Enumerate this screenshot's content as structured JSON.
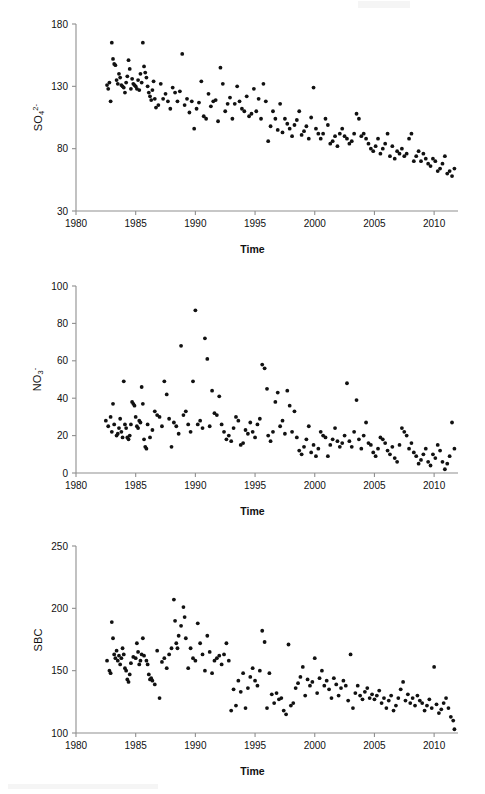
{
  "figure": {
    "panel_count": 3,
    "background": "#ffffff",
    "axis_color": "#8f8f8f",
    "point_color": "#111111"
  },
  "chart_data": [
    {
      "type": "scatter",
      "title": "",
      "ylabel": "SO4 2-",
      "ylabel_base": "SO",
      "ylabel_sub": "4",
      "ylabel_sup": "2-",
      "xlabel": "Time",
      "xlim": [
        1980,
        2012
      ],
      "ylim": [
        30,
        180
      ],
      "xticks": [
        1980,
        1985,
        1990,
        1995,
        2000,
        2005,
        2010
      ],
      "yticks": [
        30,
        80,
        130,
        180
      ],
      "grid": false,
      "legend": "none",
      "x": [
        1982.6,
        1982.7,
        1982.8,
        1982.9,
        1983.0,
        1983.1,
        1983.2,
        1983.3,
        1983.4,
        1983.5,
        1983.6,
        1983.7,
        1983.8,
        1983.9,
        1984.0,
        1984.1,
        1984.2,
        1984.3,
        1984.4,
        1984.5,
        1984.6,
        1984.7,
        1984.8,
        1984.9,
        1985.0,
        1985.1,
        1985.2,
        1985.3,
        1985.4,
        1985.5,
        1985.6,
        1985.7,
        1985.8,
        1985.9,
        1986.0,
        1986.1,
        1986.2,
        1986.3,
        1986.4,
        1986.5,
        1986.6,
        1986.7,
        1986.9,
        1987.1,
        1987.3,
        1987.5,
        1987.7,
        1987.9,
        1988.1,
        1988.3,
        1988.5,
        1988.7,
        1988.9,
        1989.1,
        1989.3,
        1989.5,
        1989.7,
        1989.9,
        1990.1,
        1990.3,
        1990.5,
        1990.7,
        1990.9,
        1991.1,
        1991.3,
        1991.5,
        1991.7,
        1991.9,
        1992.1,
        1992.3,
        1992.5,
        1992.7,
        1992.9,
        1993.1,
        1993.3,
        1993.5,
        1993.7,
        1993.9,
        1994.1,
        1994.3,
        1994.5,
        1994.7,
        1994.9,
        1995.1,
        1995.3,
        1995.5,
        1995.7,
        1995.9,
        1996.1,
        1996.3,
        1996.5,
        1996.7,
        1996.9,
        1997.1,
        1997.3,
        1997.5,
        1997.7,
        1997.9,
        1998.1,
        1998.3,
        1998.5,
        1998.7,
        1998.9,
        1999.1,
        1999.3,
        1999.5,
        1999.7,
        1999.9,
        2000.1,
        2000.3,
        2000.5,
        2000.7,
        2000.9,
        2001.1,
        2001.3,
        2001.5,
        2001.7,
        2001.9,
        2002.1,
        2002.3,
        2002.5,
        2002.7,
        2002.9,
        2003.1,
        2003.3,
        2003.5,
        2003.7,
        2003.9,
        2004.1,
        2004.3,
        2004.5,
        2004.7,
        2004.9,
        2005.1,
        2005.3,
        2005.5,
        2005.7,
        2005.9,
        2006.1,
        2006.3,
        2006.5,
        2006.7,
        2006.9,
        2007.1,
        2007.3,
        2007.5,
        2007.7,
        2007.9,
        2008.1,
        2008.3,
        2008.5,
        2008.7,
        2008.9,
        2009.1,
        2009.3,
        2009.5,
        2009.7,
        2009.9,
        2010.1,
        2010.3,
        2010.5,
        2010.7,
        2010.9,
        2011.1,
        2011.3,
        2011.5,
        2011.7
      ],
      "y": [
        131,
        128,
        133,
        118,
        165,
        152,
        148,
        147,
        135,
        132,
        140,
        137,
        131,
        130,
        129,
        125,
        133,
        138,
        151,
        144,
        128,
        136,
        132,
        131,
        130,
        128,
        135,
        127,
        140,
        133,
        165,
        146,
        141,
        137,
        130,
        125,
        122,
        119,
        127,
        134,
        120,
        113,
        115,
        132,
        120,
        124,
        118,
        112,
        129,
        125,
        118,
        126,
        156,
        115,
        120,
        109,
        118,
        96,
        112,
        117,
        134,
        106,
        104,
        124,
        114,
        118,
        119,
        102,
        145,
        132,
        110,
        116,
        121,
        104,
        116,
        130,
        118,
        112,
        110,
        122,
        106,
        108,
        128,
        110,
        120,
        104,
        132,
        118,
        86,
        98,
        110,
        104,
        95,
        116,
        93,
        104,
        100,
        96,
        90,
        99,
        103,
        110,
        91,
        94,
        98,
        88,
        105,
        129,
        96,
        92,
        88,
        92,
        104,
        99,
        84,
        86,
        90,
        82,
        92,
        96,
        90,
        88,
        84,
        86,
        92,
        108,
        104,
        90,
        92,
        88,
        84,
        80,
        78,
        82,
        88,
        76,
        80,
        84,
        92,
        74,
        82,
        72,
        78,
        76,
        80,
        74,
        76,
        88,
        92,
        70,
        74,
        78,
        70,
        76,
        72,
        68,
        66,
        72,
        70,
        62,
        64,
        68,
        74,
        60,
        62,
        58,
        64,
        56,
        54,
        58,
        52
      ]
    },
    {
      "type": "scatter",
      "title": "",
      "ylabel": "NO3 -",
      "ylabel_base": "NO",
      "ylabel_sub": "3",
      "ylabel_sup": "-",
      "xlabel": "Time",
      "xlim": [
        1980,
        2012
      ],
      "ylim": [
        0,
        100
      ],
      "xticks": [
        1980,
        1985,
        1990,
        1995,
        2000,
        2005,
        2010
      ],
      "yticks": [
        0,
        20,
        40,
        60,
        80,
        100
      ],
      "grid": false,
      "legend": "none",
      "x": [
        1982.5,
        1982.7,
        1982.9,
        1983.0,
        1983.1,
        1983.2,
        1983.4,
        1983.5,
        1983.6,
        1983.7,
        1983.8,
        1983.9,
        1984.0,
        1984.1,
        1984.2,
        1984.3,
        1984.4,
        1984.5,
        1984.6,
        1984.7,
        1984.8,
        1984.9,
        1985.0,
        1985.1,
        1985.2,
        1985.3,
        1985.4,
        1985.5,
        1985.6,
        1985.7,
        1985.8,
        1985.9,
        1986.0,
        1986.2,
        1986.4,
        1986.6,
        1986.8,
        1987.0,
        1987.2,
        1987.4,
        1987.6,
        1987.8,
        1988.0,
        1988.2,
        1988.4,
        1988.6,
        1988.8,
        1989.0,
        1989.2,
        1989.4,
        1989.6,
        1989.8,
        1990.0,
        1990.2,
        1990.4,
        1990.6,
        1990.8,
        1991.0,
        1991.2,
        1991.4,
        1991.6,
        1991.8,
        1992.0,
        1992.2,
        1992.4,
        1992.6,
        1992.8,
        1993.0,
        1993.2,
        1993.4,
        1993.6,
        1993.8,
        1994.0,
        1994.2,
        1994.4,
        1994.6,
        1994.8,
        1995.0,
        1995.2,
        1995.4,
        1995.6,
        1995.8,
        1996.0,
        1996.1,
        1996.3,
        1996.5,
        1996.7,
        1996.9,
        1997.1,
        1997.3,
        1997.5,
        1997.7,
        1997.9,
        1998.1,
        1998.3,
        1998.5,
        1998.7,
        1998.9,
        1999.1,
        1999.3,
        1999.5,
        1999.7,
        1999.9,
        2000.1,
        2000.3,
        2000.5,
        2000.7,
        2000.9,
        2001.1,
        2001.3,
        2001.5,
        2001.7,
        2001.9,
        2002.1,
        2002.3,
        2002.5,
        2002.7,
        2002.9,
        2003.1,
        2003.3,
        2003.5,
        2003.7,
        2003.9,
        2004.1,
        2004.3,
        2004.5,
        2004.7,
        2004.9,
        2005.1,
        2005.3,
        2005.5,
        2005.7,
        2005.9,
        2006.1,
        2006.3,
        2006.5,
        2006.7,
        2006.9,
        2007.1,
        2007.3,
        2007.5,
        2007.7,
        2007.9,
        2008.1,
        2008.3,
        2008.5,
        2008.7,
        2008.9,
        2009.1,
        2009.3,
        2009.5,
        2009.7,
        2009.9,
        2010.1,
        2010.3,
        2010.5,
        2010.7,
        2010.9,
        2011.1,
        2011.3,
        2011.5,
        2011.7
      ],
      "y": [
        28,
        25,
        30,
        22,
        37,
        26,
        20,
        21,
        24,
        29,
        22,
        19,
        49,
        26,
        24,
        19,
        18,
        20,
        26,
        38,
        37,
        36,
        30,
        25,
        24,
        28,
        27,
        46,
        37,
        18,
        14,
        13,
        26,
        19,
        23,
        33,
        31,
        30,
        25,
        49,
        42,
        29,
        14,
        27,
        25,
        21,
        68,
        31,
        33,
        26,
        22,
        49,
        87,
        26,
        28,
        24,
        72,
        61,
        25,
        44,
        32,
        31,
        41,
        26,
        22,
        18,
        20,
        17,
        24,
        30,
        28,
        15,
        16,
        23,
        21,
        27,
        22,
        19,
        26,
        29,
        58,
        56,
        45,
        20,
        17,
        22,
        38,
        43,
        25,
        28,
        21,
        44,
        36,
        22,
        33,
        19,
        12,
        10,
        14,
        18,
        25,
        11,
        15,
        9,
        13,
        22,
        20,
        19,
        9,
        15,
        18,
        24,
        17,
        14,
        16,
        20,
        48,
        17,
        14,
        22,
        39,
        18,
        13,
        20,
        27,
        16,
        15,
        11,
        9,
        13,
        19,
        18,
        16,
        12,
        10,
        14,
        8,
        6,
        15,
        24,
        22,
        20,
        13,
        16,
        11,
        9,
        5,
        7,
        10,
        13,
        6,
        4,
        10,
        8,
        15,
        12,
        6,
        2,
        5,
        9,
        27,
        13,
        7,
        9
      ]
    },
    {
      "type": "scatter",
      "title": "",
      "ylabel": "SBC",
      "ylabel_base": "SBC",
      "ylabel_sub": "",
      "ylabel_sup": "",
      "xlabel": "Time",
      "xlim": [
        1980,
        2012
      ],
      "ylim": [
        100,
        250
      ],
      "xticks": [
        1980,
        1985,
        1990,
        1995,
        2000,
        2005,
        2010
      ],
      "yticks": [
        100,
        150,
        200,
        250
      ],
      "grid": false,
      "legend": "none",
      "x": [
        1982.6,
        1982.8,
        1982.9,
        1983.0,
        1983.1,
        1983.2,
        1983.3,
        1983.4,
        1983.5,
        1983.6,
        1983.7,
        1983.8,
        1983.9,
        1984.0,
        1984.1,
        1984.2,
        1984.3,
        1984.4,
        1984.5,
        1984.6,
        1984.8,
        1985.0,
        1985.1,
        1985.2,
        1985.3,
        1985.4,
        1985.5,
        1985.6,
        1985.7,
        1985.9,
        1986.0,
        1986.1,
        1986.2,
        1986.3,
        1986.4,
        1986.6,
        1986.8,
        1987.0,
        1987.2,
        1987.4,
        1987.6,
        1987.8,
        1988.0,
        1988.2,
        1988.3,
        1988.4,
        1988.5,
        1988.6,
        1988.8,
        1989.0,
        1989.1,
        1989.2,
        1989.4,
        1989.6,
        1989.8,
        1990.0,
        1990.2,
        1990.4,
        1990.6,
        1990.8,
        1991.0,
        1991.2,
        1991.4,
        1991.6,
        1991.8,
        1992.0,
        1992.2,
        1992.4,
        1992.6,
        1992.8,
        1993.0,
        1993.2,
        1993.4,
        1993.6,
        1993.8,
        1994.0,
        1994.2,
        1994.4,
        1994.6,
        1994.8,
        1995.0,
        1995.2,
        1995.4,
        1995.6,
        1995.8,
        1996.0,
        1996.2,
        1996.4,
        1996.6,
        1996.8,
        1997.0,
        1997.2,
        1997.4,
        1997.6,
        1997.8,
        1998.0,
        1998.2,
        1998.4,
        1998.6,
        1998.8,
        1999.0,
        1999.2,
        1999.4,
        1999.6,
        1999.8,
        2000.0,
        2000.2,
        2000.4,
        2000.6,
        2000.8,
        2001.0,
        2001.2,
        2001.4,
        2001.6,
        2001.8,
        2002.0,
        2002.2,
        2002.4,
        2002.6,
        2002.8,
        2003.0,
        2003.2,
        2003.4,
        2003.6,
        2003.8,
        2004.0,
        2004.2,
        2004.4,
        2004.6,
        2004.8,
        2005.0,
        2005.2,
        2005.4,
        2005.6,
        2005.8,
        2006.0,
        2006.2,
        2006.4,
        2006.6,
        2006.8,
        2007.0,
        2007.2,
        2007.4,
        2007.6,
        2007.8,
        2008.0,
        2008.2,
        2008.4,
        2008.6,
        2008.8,
        2009.0,
        2009.2,
        2009.4,
        2009.6,
        2009.8,
        2010.0,
        2010.2,
        2010.4,
        2010.6,
        2010.8,
        2011.0,
        2011.2,
        2011.4,
        2011.6,
        2011.7
      ],
      "y": [
        158,
        150,
        148,
        189,
        176,
        163,
        160,
        166,
        158,
        162,
        155,
        160,
        168,
        163,
        152,
        150,
        143,
        141,
        147,
        156,
        161,
        160,
        172,
        165,
        155,
        158,
        163,
        176,
        162,
        158,
        155,
        147,
        143,
        144,
        142,
        139,
        166,
        128,
        157,
        160,
        152,
        163,
        168,
        207,
        190,
        172,
        168,
        178,
        186,
        201,
        193,
        176,
        152,
        168,
        160,
        158,
        188,
        172,
        163,
        150,
        178,
        165,
        148,
        158,
        160,
        162,
        155,
        163,
        172,
        158,
        118,
        135,
        122,
        142,
        133,
        148,
        120,
        136,
        145,
        152,
        142,
        138,
        150,
        182,
        173,
        120,
        148,
        131,
        124,
        132,
        127,
        128,
        118,
        115,
        171,
        122,
        124,
        136,
        140,
        145,
        153,
        130,
        143,
        138,
        141,
        160,
        132,
        144,
        150,
        138,
        142,
        135,
        128,
        144,
        139,
        130,
        136,
        142,
        138,
        126,
        163,
        120,
        132,
        138,
        130,
        127,
        133,
        136,
        128,
        131,
        127,
        130,
        134,
        124,
        128,
        120,
        126,
        130,
        118,
        122,
        128,
        135,
        141,
        126,
        131,
        124,
        128,
        122,
        130,
        126,
        124,
        118,
        122,
        127,
        120,
        153,
        123,
        116,
        119,
        124,
        128,
        120,
        113,
        110,
        103,
        117
      ]
    }
  ],
  "labels": {
    "xaxis": "Time",
    "panel1_y": "SO",
    "panel2_y": "NO",
    "panel3_y": "SBC"
  }
}
